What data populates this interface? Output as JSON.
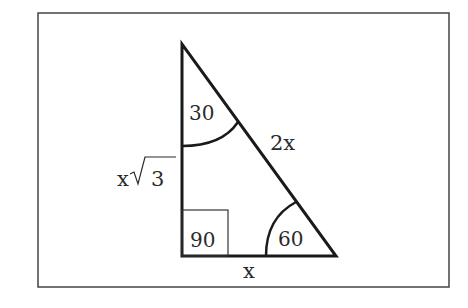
{
  "diagram": {
    "type": "right-triangle-30-60-90",
    "angles": {
      "top": "30",
      "right_angle": "90",
      "bottom_right": "60"
    },
    "sides": {
      "hypotenuse": "2x",
      "vertical_leg_prefix": "x",
      "vertical_leg_radicand": "3",
      "horizontal_leg": "x"
    },
    "colors": {
      "stroke": "#1a1a1a",
      "frame": "#444444",
      "background": "#ffffff"
    }
  }
}
